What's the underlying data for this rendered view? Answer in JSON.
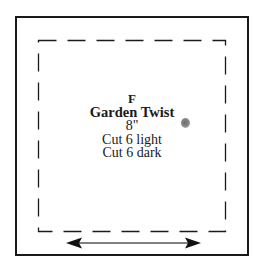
{
  "template": {
    "letter": "F",
    "title": "Garden Twist",
    "size": "8\"",
    "cut_lines": [
      "Cut 6 light",
      "Cut 6 dark"
    ]
  },
  "diagram": {
    "outer_border": "solid",
    "inner_border": "dashed",
    "grain_arrow": "double-headed horizontal",
    "colors": {
      "stroke": "#1a1a1a",
      "background": "#ffffff",
      "smudge": "#7a7a7a"
    }
  }
}
